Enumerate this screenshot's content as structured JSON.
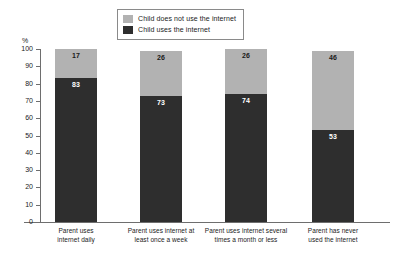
{
  "chart_data": {
    "type": "bar",
    "subtype": "stacked-bar-100",
    "title": "",
    "xlabel": "",
    "ylabel": "%",
    "ylim": [
      0,
      100
    ],
    "yticks": [
      0,
      10,
      20,
      30,
      40,
      50,
      60,
      70,
      80,
      90,
      100
    ],
    "grid": false,
    "legend_position": "top-center",
    "categories": [
      "Parent uses internet daily",
      "Parent uses internet at least once a week",
      "Parent uses internet several times a month or less",
      "Parent has never used the internet"
    ],
    "category_lines": [
      [
        "Parent uses",
        "internet daily"
      ],
      [
        "Parent uses internet at",
        "least once a week"
      ],
      [
        "Parent uses internet several",
        "times a month or less"
      ],
      [
        "Parent has never",
        "used the internet"
      ]
    ],
    "series": [
      {
        "name": "Child does not use the internet",
        "color": "#b2b2b2",
        "values": [
          17,
          26,
          26,
          46
        ]
      },
      {
        "name": "Child uses the internet",
        "color": "#2e2e2e",
        "values": [
          83,
          73,
          74,
          53
        ]
      }
    ]
  },
  "legend": {
    "entries": [
      {
        "label": "Child does not use the internet",
        "color": "#b2b2b2"
      },
      {
        "label": "Child uses the internet",
        "color": "#2e2e2e"
      }
    ]
  },
  "axis": {
    "y_unit": "%",
    "tick_labels": [
      "100",
      "90",
      "80",
      "70",
      "60",
      "50",
      "40",
      "30",
      "20",
      "10",
      "0"
    ]
  }
}
